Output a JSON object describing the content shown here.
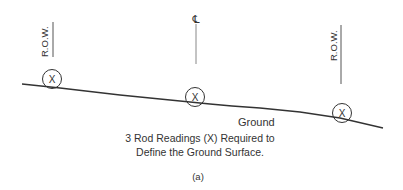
{
  "diagram": {
    "markers": {
      "row_left": "R.O.W.",
      "centerline": "℄",
      "row_right": "R.O.W."
    },
    "rod_reading_symbol": "X",
    "ground_label": "Ground",
    "caption_line1": "3 Rod Readings (X) Required to",
    "caption_line2": "Define the Ground Surface.",
    "figure_label": "(a)",
    "colors": {
      "line": "#333333",
      "marker_line": "#666666",
      "background": "#ffffff"
    }
  }
}
